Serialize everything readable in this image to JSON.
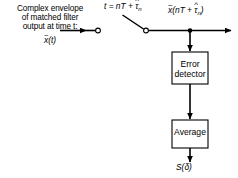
{
  "diagram": {
    "type": "signal-processing-block-diagram",
    "background_color": "#ffffff",
    "line_color": "#000000",
    "box_fill_color": "#ffffff",
    "box_border_color": "#000000",
    "width": 238,
    "height": 178,
    "input": {
      "caption_line_1": "Complex envelope",
      "caption_line_2": "of matched filter",
      "caption_line_3": "output at time t:",
      "symbol_base": "x",
      "symbol_tilde": "~",
      "symbol_arg": "(t)"
    },
    "switch": {
      "label_lhs": "t = nT + ",
      "label_tau": "τ",
      "label_hat": "^",
      "label_sub": "n",
      "type": "sampler-switch",
      "contacts": 2
    },
    "output": {
      "symbol_base": "x",
      "symbol_tilde": "~",
      "symbol_arg_open": "(nT + ",
      "symbol_tau": "τ",
      "symbol_hat": "^",
      "symbol_sub": "n",
      "symbol_arg_close": ")"
    },
    "blocks": [
      {
        "id": "error-detector",
        "line_1": "Error",
        "line_2": "detector",
        "x": 172,
        "y": 52,
        "w": 36,
        "h": 32
      },
      {
        "id": "average",
        "line_1": "Average",
        "line_2": "",
        "x": 172,
        "y": 120,
        "w": 36,
        "h": 28
      }
    ],
    "result": {
      "symbol_base": "S",
      "symbol_arg_open": "(",
      "symbol_delta": "δ",
      "symbol_arg_close": ")"
    }
  }
}
